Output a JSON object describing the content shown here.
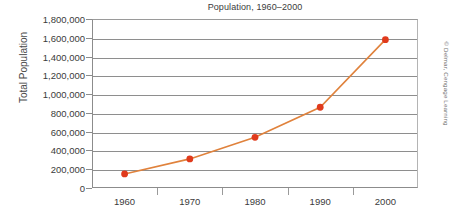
{
  "chart_data": {
    "type": "line",
    "title": "Population, 1960–2000",
    "xlabel": "",
    "ylabel": "Total Population",
    "categories": [
      "1960",
      "1970",
      "1980",
      "1990",
      "2000"
    ],
    "x": [
      1960,
      1970,
      1980,
      1990,
      2000
    ],
    "values": [
      150000,
      310000,
      540000,
      860000,
      1580000
    ],
    "series": [
      {
        "name": "Total Population",
        "values": [
          150000,
          310000,
          540000,
          860000,
          1580000
        ]
      }
    ],
    "ylim": [
      0,
      1800000
    ],
    "ytick_step": 200000,
    "ytick_labels": [
      "1,800,000",
      "1,600,000",
      "1,400,000",
      "1,200,000",
      "1,000,000",
      "800,000",
      "600,000",
      "400,000",
      "200,000",
      "0"
    ],
    "ytick_values": [
      1800000,
      1600000,
      1400000,
      1200000,
      1000000,
      800000,
      600000,
      400000,
      200000,
      0
    ],
    "xtick_labels": [
      "1960",
      "1970",
      "1980",
      "1990",
      "2000"
    ],
    "grid": "horizontal",
    "legend": "none",
    "marker": "circle",
    "colors": {
      "line": "#e0823c",
      "marker": "#e03a1c",
      "gridline": "#8e8e8e",
      "axis": "#8c8c8c",
      "text": "#3b3b3b",
      "background": "#ffffff"
    }
  },
  "credit": {
    "text": "© Delmar, Cengage Learning"
  }
}
